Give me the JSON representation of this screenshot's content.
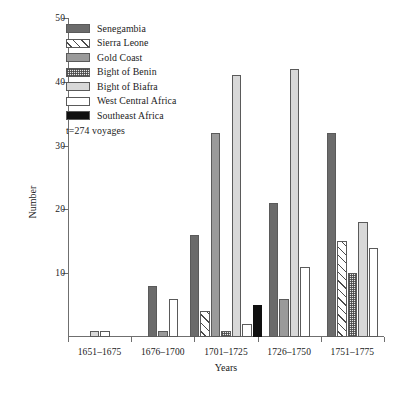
{
  "chart_data": {
    "type": "bar",
    "title": "",
    "xlabel": "Years",
    "ylabel": "Number",
    "ylim": [
      0,
      50
    ],
    "yticks": [
      0,
      10,
      20,
      30,
      40,
      50
    ],
    "ytick_labels": [
      "0",
      "10",
      "20",
      "30",
      "40",
      "50"
    ],
    "grid": false,
    "legend_position": "top-left",
    "annotation": "t=274 voyages",
    "categories": [
      "1651–1675",
      "1676–1700",
      "1701–1725",
      "1726–1750",
      "1751–1775"
    ],
    "series": [
      {
        "name": "Senegambia",
        "pattern": "solid-dark-gray",
        "color": "#6b6b6b",
        "values": [
          0,
          8,
          16,
          21,
          32
        ]
      },
      {
        "name": "Sierra Leone",
        "pattern": "diagonal-hatch",
        "color": "#ffffff",
        "values": [
          0,
          0,
          4,
          0,
          15
        ]
      },
      {
        "name": "Gold Coast",
        "pattern": "solid-mid-gray",
        "color": "#9a9a9a",
        "values": [
          0,
          1,
          32,
          6,
          0
        ]
      },
      {
        "name": "Bight of Benin",
        "pattern": "cross-hatch-dotted",
        "color": "#e8e8e8",
        "values": [
          0,
          0,
          1,
          0,
          10
        ]
      },
      {
        "name": "Bight of Biafra",
        "pattern": "solid-light-gray",
        "color": "#d8d8d8",
        "values": [
          1,
          0,
          41,
          42,
          18
        ]
      },
      {
        "name": "West Central Africa",
        "pattern": "solid-white",
        "color": "#ffffff",
        "values": [
          1,
          6,
          2,
          11,
          14
        ]
      },
      {
        "name": "Southeast Africa",
        "pattern": "solid-black",
        "color": "#101010",
        "values": [
          0,
          0,
          5,
          0,
          0
        ]
      }
    ]
  },
  "legend": {
    "items": [
      {
        "label": "Senegambia"
      },
      {
        "label": "Sierra Leone"
      },
      {
        "label": "Gold Coast"
      },
      {
        "label": "Bight of Benin"
      },
      {
        "label": "Bight of Biafra"
      },
      {
        "label": "West Central Africa"
      },
      {
        "label": "Southeast Africa"
      }
    ],
    "note": "t=274 voyages"
  }
}
